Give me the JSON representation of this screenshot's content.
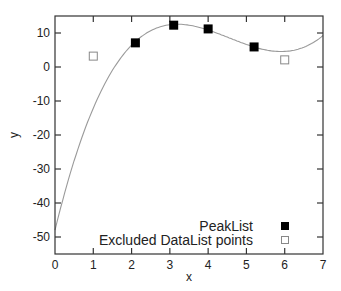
{
  "chart_data": {
    "type": "scatter",
    "title": "",
    "xlabel": "x",
    "ylabel": "y",
    "xlim": [
      0,
      7
    ],
    "ylim": [
      -55,
      15
    ],
    "xticks": [
      0,
      1,
      2,
      3,
      4,
      5,
      6,
      7
    ],
    "yticks": [
      10,
      0,
      -10,
      -20,
      -30,
      -40,
      -50
    ],
    "grid": false,
    "legend_position": "lower right (inside)",
    "series": [
      {
        "name": "PeakList",
        "marker": "filled-square",
        "color": "#000000",
        "points": [
          [
            2.1,
            7.1
          ],
          [
            3.1,
            12.3
          ],
          [
            4.0,
            11.2
          ],
          [
            5.2,
            5.9
          ]
        ]
      },
      {
        "name": "Excluded DataList points",
        "marker": "open-square",
        "color": "#888888",
        "points": [
          [
            1.0,
            3.2
          ],
          [
            6.0,
            2.1
          ]
        ]
      },
      {
        "name": "fit curve",
        "type": "line",
        "color": "#999999",
        "x": [
          0,
          0.5,
          1,
          1.5,
          2,
          2.5,
          3,
          3.2,
          3.5,
          4,
          4.5,
          5,
          5.5,
          5.9,
          6.5,
          7
        ],
        "y": [
          -48,
          -26.9,
          -10.6,
          0.9,
          8.3,
          12.1,
          12.8,
          12.6,
          12.1,
          10.4,
          8.0,
          5.9,
          4.7,
          4.5,
          5.5,
          7.5
        ]
      }
    ]
  },
  "legend": {
    "items": [
      {
        "label": "PeakList",
        "marker": "filled-square"
      },
      {
        "label": "Excluded DataList points",
        "marker": "open-square"
      }
    ]
  },
  "axes": {
    "xlabel": "x",
    "ylabel": "y",
    "xtick_labels": [
      "0",
      "1",
      "2",
      "3",
      "4",
      "5",
      "6",
      "7"
    ],
    "ytick_labels": [
      "10",
      "0",
      "-10",
      "-20",
      "-30",
      "-40",
      "-50"
    ]
  }
}
